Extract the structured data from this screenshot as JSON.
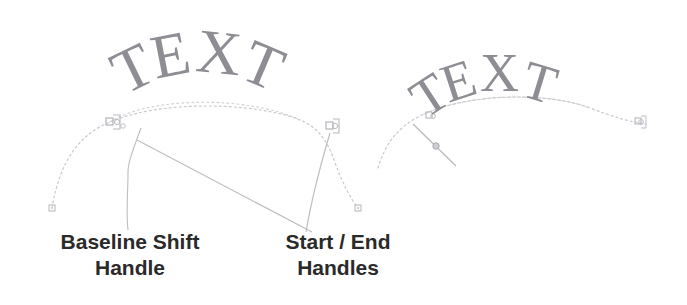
{
  "figure": {
    "background_color": "#ffffff",
    "width": 687,
    "height": 305
  },
  "specimens": [
    {
      "id": "left",
      "name": "text-on-path-default",
      "sample_text": "TEXT",
      "letters": [
        "T",
        "E",
        "X",
        "T"
      ],
      "text_color": "#8d8d93",
      "path_color": "#c9c9cf",
      "handle_color": "#b3b3ba",
      "description": "Text sitting on the path with start and end handles at the path ends"
    },
    {
      "id": "right",
      "name": "text-on-path-baseline-shifted",
      "sample_text": "TEXT",
      "letters": [
        "T",
        "E",
        "X",
        "T"
      ],
      "text_color": "#8d8d93",
      "path_color": "#c9c9cf",
      "handle_color": "#b3b3ba",
      "description": "Text shifted along the path showing the baseline shift handle dragged"
    }
  ],
  "callouts": [
    {
      "id": "baseline-shift",
      "line1": "Baseline Shift",
      "line2": "Handle",
      "color": "#2a2a2a"
    },
    {
      "id": "start-end",
      "line1": "Start / End",
      "line2": "Handles",
      "color": "#2a2a2a"
    }
  ],
  "markers": {
    "start_handle_label": "start-handle",
    "end_handle_label": "end-handle",
    "baseline_handle_label": "baseline-shift-handle",
    "anchor_point_label": "path-anchor-point"
  },
  "colors": {
    "text_gray": "#8d8d93",
    "path_gray": "#c9c9cf",
    "handle_gray": "#b3b3ba",
    "label_black": "#2a2a2a",
    "leader_gray": "#bdbdc4",
    "background": "#ffffff"
  }
}
